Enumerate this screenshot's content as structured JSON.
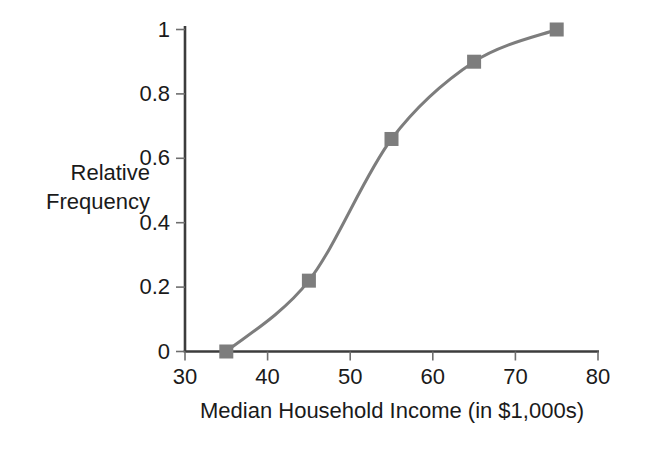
{
  "chart_data": {
    "type": "line",
    "title": "",
    "subtitle": "",
    "xlabel": "Median Household Income (in $1,000s)",
    "ylabel": "Relative Frequency",
    "ylabel_lines": [
      "Relative",
      "Frequency"
    ],
    "x": [
      35,
      45,
      55,
      65,
      75
    ],
    "values": [
      0,
      0.22,
      0.66,
      0.9,
      1
    ],
    "series": [
      {
        "name": "Cumulative relative frequency",
        "x": [
          35,
          45,
          55,
          65,
          75
        ],
        "values": [
          0,
          0.22,
          0.66,
          0.9,
          1
        ]
      }
    ],
    "xlim": [
      30,
      80
    ],
    "ylim": [
      0,
      1
    ],
    "xticks": [
      30,
      40,
      50,
      60,
      70,
      80
    ],
    "xtick_labels": [
      "30",
      "40",
      "50",
      "60",
      "70",
      "80"
    ],
    "yticks": [
      0,
      0.2,
      0.4,
      0.6,
      0.8,
      1
    ],
    "ytick_labels": [
      "0",
      "0.2",
      "0.4",
      "0.6",
      "0.8",
      "1"
    ],
    "grid": false,
    "legend": "none",
    "marker": "square",
    "smooth": true,
    "colors": {
      "line": "#7d7d7d",
      "marker": "#7d7d7d",
      "axis": "#3c3c3c",
      "text": "#1a1a1a",
      "background": "#ffffff"
    }
  }
}
